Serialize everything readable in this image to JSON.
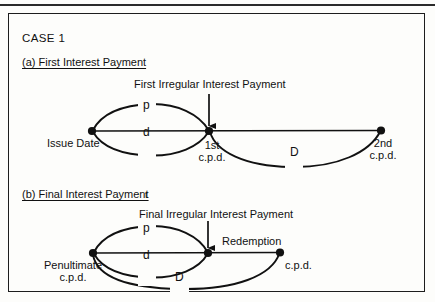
{
  "figure": {
    "case_title": "CASE 1",
    "panel_a": {
      "heading": "(a) First Interest Payment",
      "callout": "First Irregular Interest Payment",
      "nodes": [
        {
          "name": "issue-date",
          "label": "Issue Date",
          "x": 92,
          "y": 131
        },
        {
          "name": "first-cpd",
          "label_line1": "1st",
          "label_line2": "c.p.d.",
          "x": 209,
          "y": 131
        },
        {
          "name": "second-cpd",
          "label_line1": "2nd",
          "label_line2": "c.p.d.",
          "x": 381,
          "y": 130
        }
      ],
      "arcs": [
        {
          "label": "p",
          "from": "issue-date",
          "to": "first-cpd",
          "side": "above"
        },
        {
          "label": "d",
          "from": "issue-date",
          "to": "first-cpd",
          "side": "below"
        },
        {
          "label": "D",
          "from": "first-cpd",
          "to": "second-cpd",
          "side": "below"
        }
      ]
    },
    "panel_b": {
      "heading": "(b) Final Interest Payment",
      "heading_suffix": "t",
      "callout": "Final Irregular Interest Payment",
      "nodes": [
        {
          "name": "penultimate-cpd",
          "label_line1": "Penultimate",
          "label_line2": "c.p.d.",
          "x": 93,
          "y": 253
        },
        {
          "name": "final-irregular",
          "label": "Redemption",
          "x": 208,
          "y": 253
        },
        {
          "name": "redemption-cpd",
          "label": "c.p.d.",
          "x": 280,
          "y": 252
        }
      ],
      "arcs": [
        {
          "label": "p",
          "from": "penultimate-cpd",
          "to": "final-irregular",
          "side": "above"
        },
        {
          "label": "d",
          "from": "penultimate-cpd",
          "to": "final-irregular",
          "side": "below"
        },
        {
          "label": "D",
          "from": "penultimate-cpd",
          "to": "redemption-cpd",
          "side": "below"
        }
      ]
    },
    "colors": {
      "ink": "#111111",
      "paper": "#fdfdfb",
      "border": "#1d1d1d"
    }
  }
}
